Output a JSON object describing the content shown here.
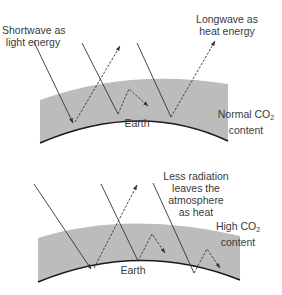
{
  "colors": {
    "atmosphere_fill": "#bcbcbc",
    "earth_line": "#1a1a1a",
    "arrow": "#333333",
    "text": "#3a3a3a",
    "background": "#ffffff"
  },
  "top_panel": {
    "shortwave_label_line1": "Shortwave as",
    "shortwave_label_line2": "light energy",
    "longwave_label_line1": "Longwave as",
    "longwave_label_line2": "heat energy",
    "earth_label": "Earth",
    "co2_label_prefix": "Normal CO",
    "co2_label_sub": "2",
    "co2_label_line2": "content"
  },
  "bottom_panel": {
    "less_radiation_line1": "Less radiation",
    "less_radiation_line2": "leaves the",
    "less_radiation_line3": "atmosphere",
    "less_radiation_line4": "as heat",
    "earth_label": "Earth",
    "co2_label_prefix": "High CO",
    "co2_label_sub": "2",
    "co2_label_line2": "content"
  },
  "legend": {
    "solid_arrow": "incoming shortwave radiation",
    "dashed_arrow": "outgoing longwave radiation"
  }
}
